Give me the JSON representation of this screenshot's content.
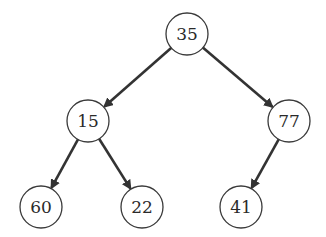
{
  "diagram": {
    "type": "binary-tree",
    "nodes": [
      {
        "id": "n35",
        "label": "35",
        "cx": 187,
        "cy": 34
      },
      {
        "id": "n15",
        "label": "15",
        "cx": 88,
        "cy": 121
      },
      {
        "id": "n77",
        "label": "77",
        "cx": 289,
        "cy": 121
      },
      {
        "id": "n60",
        "label": "60",
        "cx": 41,
        "cy": 207
      },
      {
        "id": "n22",
        "label": "22",
        "cx": 142,
        "cy": 207
      },
      {
        "id": "n41",
        "label": "41",
        "cx": 241,
        "cy": 207
      }
    ],
    "edges": [
      {
        "from": "35",
        "to": "15"
      },
      {
        "from": "35",
        "to": "77"
      },
      {
        "from": "15",
        "to": "60"
      },
      {
        "from": "15",
        "to": "22"
      },
      {
        "from": "77",
        "to": "41"
      }
    ],
    "colors": {
      "stroke": "#3a3a3a",
      "edge": "#333333",
      "background": "#ffffff"
    }
  }
}
